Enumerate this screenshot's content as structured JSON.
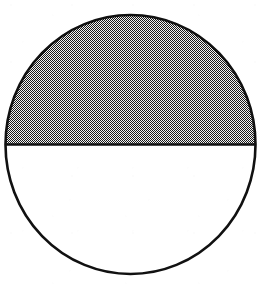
{
  "figure": {
    "name": "half-shaded-circle",
    "canvas": {
      "width": 267,
      "height": 284,
      "background_color": "#ffffff"
    },
    "circle": {
      "center_x": 130.5,
      "center_y": 144.5,
      "radius_x": 125,
      "radius_y": 129.5,
      "outline_color": "#111111",
      "outline_width": 2.6,
      "fill_color": "#ffffff"
    },
    "divider": {
      "label": "horizontal diameter",
      "y": 144.5,
      "x_start": 5.5,
      "x_end": 255.5,
      "color": "#111111",
      "width": 2.6
    },
    "shaded_region": {
      "label": "upper half",
      "position": "top",
      "fill_style": "50% checkerboard dither",
      "fill_color": "#6e6e6e",
      "dither_dark": "#1a1a1a",
      "dither_light": "#f2f2f2"
    },
    "unshaded_region": {
      "label": "lower half",
      "position": "bottom",
      "fill_style": "solid",
      "fill_color": "#ffffff"
    }
  },
  "chart_data": {
    "type": "pie",
    "title": "",
    "subtitle": "",
    "xlabel": "",
    "ylabel": "",
    "legend_position": "none",
    "grid": false,
    "labels": [
      "shaded",
      "unshaded"
    ],
    "values": [
      50,
      50
    ],
    "fraction_shaded": "1/2",
    "shaded_percent": 50,
    "unshaded_percent": 50,
    "slice_colors": [
      "#6e6e6e",
      "#ffffff"
    ],
    "start_angle": 180,
    "annotations": []
  }
}
